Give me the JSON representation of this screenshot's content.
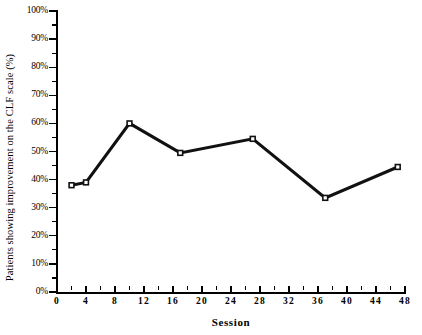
{
  "chart_data": {
    "type": "line",
    "title": "",
    "xlabel": "Session",
    "ylabel": "Patients showing improvement on the CLF scale (%)",
    "xlim": [
      0,
      48
    ],
    "ylim": [
      0,
      100
    ],
    "xticks": [
      0,
      4,
      8,
      12,
      16,
      20,
      24,
      28,
      32,
      36,
      40,
      44,
      48
    ],
    "xtick_labels": [
      "0",
      "4",
      "8",
      "12",
      "16",
      "20",
      "24",
      "28",
      "32",
      "36",
      "40",
      "44",
      "48"
    ],
    "yticks": [
      0,
      10,
      20,
      30,
      40,
      50,
      60,
      70,
      80,
      90,
      100
    ],
    "ytick_labels": [
      "0%",
      "10%",
      "20%",
      "30%",
      "40%",
      "50%",
      "60%",
      "70%",
      "80%",
      "90%",
      "100%"
    ],
    "y_minor_ticks_every": 5,
    "x_minor_ticks_every": 2,
    "grid": false,
    "legend": false,
    "legend_position": "none",
    "line_color": "#111111",
    "marker": "square",
    "marker_color": "#111111",
    "x": [
      2,
      4,
      10,
      17,
      27,
      37,
      47
    ],
    "values": [
      38,
      39,
      60,
      49.5,
      54.5,
      33.5,
      44.5
    ],
    "series": [
      {
        "name": "Patients showing improvement",
        "x": [
          2,
          4,
          10,
          17,
          27,
          37,
          47
        ],
        "values": [
          38,
          39,
          60,
          49.5,
          54.5,
          33.5,
          44.5
        ]
      }
    ]
  },
  "colors": {
    "axis": "#000000",
    "line": "#111111",
    "background": "#ffffff"
  }
}
